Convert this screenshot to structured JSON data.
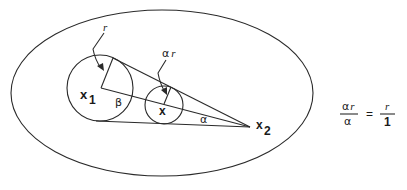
{
  "diagram": {
    "colors": {
      "stroke": "#2a2a2a",
      "text": "#1a1a1a",
      "background": "#ffffff"
    },
    "points": {
      "x1": {
        "label": "x",
        "subscript": "1"
      },
      "x": {
        "label": "x"
      },
      "x2": {
        "label": "x",
        "subscript": "2"
      }
    },
    "labels": {
      "large_radius": "r",
      "small_radius_coef": "α",
      "small_radius_var": "r",
      "beta": "β",
      "alpha": "α"
    },
    "equation": {
      "lhs_num_coef": "α",
      "lhs_num_var": "r",
      "lhs_den": "α",
      "equals": "=",
      "rhs_num": "r",
      "rhs_den": "1"
    }
  }
}
